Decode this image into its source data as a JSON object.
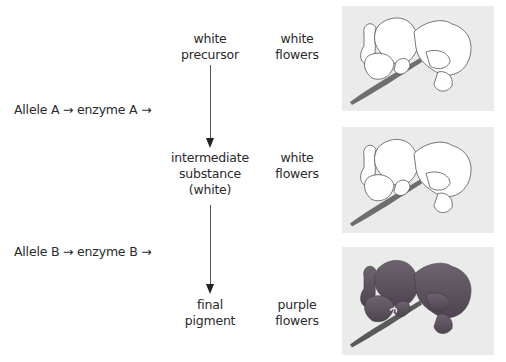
{
  "diagram": {
    "title_fragment_cut_off": "",
    "steps": [
      {
        "id": "precursor",
        "lines": [
          "white",
          "precursor"
        ],
        "phenotype": [
          "white",
          "flowers"
        ]
      },
      {
        "id": "intermediate",
        "lines": [
          "intermediate",
          "substance",
          "(white)"
        ],
        "phenotype": [
          "white",
          "flowers"
        ]
      },
      {
        "id": "final",
        "lines": [
          "final",
          "pigment"
        ],
        "phenotype": [
          "purple",
          "flowers"
        ]
      }
    ],
    "reactions": [
      {
        "text": "Allele A  → enzyme A →"
      },
      {
        "text": "Allele B → enzyme B →"
      }
    ],
    "panels": [
      {
        "subject": "white sweet pea flowers",
        "fill": "#ffffff",
        "stem": "#6e6e6e"
      },
      {
        "subject": "white sweet pea flowers",
        "fill": "#ffffff",
        "stem": "#6e6e6e"
      },
      {
        "subject": "purple sweet pea flowers",
        "fill": "#5f5661",
        "stem": "#5a5a5a"
      }
    ],
    "colors": {
      "panel_bg": "#ebebeb",
      "text": "#2a2a2a",
      "arrow": "#222222"
    }
  }
}
